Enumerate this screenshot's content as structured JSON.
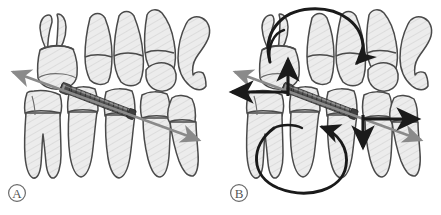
{
  "figure": {
    "background_color": "#ffffff",
    "width": 441,
    "height": 215
  },
  "palette": {
    "tooth_fill": "#e9e9e9",
    "tooth_outline": "#4a4a4a",
    "hatch_line": "#cfcfcf",
    "screw_dark": "#3a3a3a",
    "screw_mid": "#6e6e6e",
    "screw_light": "#a8a8a8",
    "gray_arrow": "#8a8a8a",
    "black_arrow": "#1a1a1a",
    "label_color": "#555555"
  },
  "panels": [
    {
      "id": "A",
      "label": "A",
      "label_style": "circled-letter",
      "description": "Lateral view of maxillary and mandibular posterior teeth with an interradicular mini-implant; a single bidirectional gray force vector passes obliquely through the implant axis.",
      "implant": {
        "name": "mini-implant-screw",
        "type": "threaded-segmented-cylinder",
        "orientation": "oblique-down-right"
      },
      "vectors": [
        {
          "name": "oblique-force-vector",
          "color": "#8a8a8a",
          "style": "double-headed-straight",
          "direction": "upper-left to lower-right"
        }
      ]
    },
    {
      "id": "B",
      "label": "B",
      "label_style": "circled-letter",
      "description": "Same dentition with an expanded force system: the oblique gray vector plus resolved black horizontal and vertical force components and two black curved moment (rotation) arrows above and below the arch.",
      "implant": {
        "name": "mini-implant-screw",
        "type": "threaded-segmented-cylinder",
        "orientation": "oblique-down-right"
      },
      "vectors": [
        {
          "name": "oblique-force-vector",
          "color": "#8a8a8a",
          "style": "double-headed-straight",
          "direction": "upper-left to lower-right"
        },
        {
          "name": "horizontal-force-left",
          "color": "#1a1a1a",
          "style": "single-headed-straight",
          "direction": "left"
        },
        {
          "name": "vertical-force-up",
          "color": "#1a1a1a",
          "style": "single-headed-straight",
          "direction": "up"
        },
        {
          "name": "horizontal-force-right",
          "color": "#1a1a1a",
          "style": "single-headed-straight",
          "direction": "right"
        },
        {
          "name": "vertical-force-down",
          "color": "#1a1a1a",
          "style": "single-headed-straight",
          "direction": "down"
        },
        {
          "name": "upper-moment-arc",
          "color": "#1a1a1a",
          "style": "curved-arrow",
          "direction": "clockwise-over-crowns"
        },
        {
          "name": "lower-moment-arc",
          "color": "#1a1a1a",
          "style": "curved-arrow",
          "direction": "counterclockwise-around-roots"
        }
      ]
    }
  ]
}
